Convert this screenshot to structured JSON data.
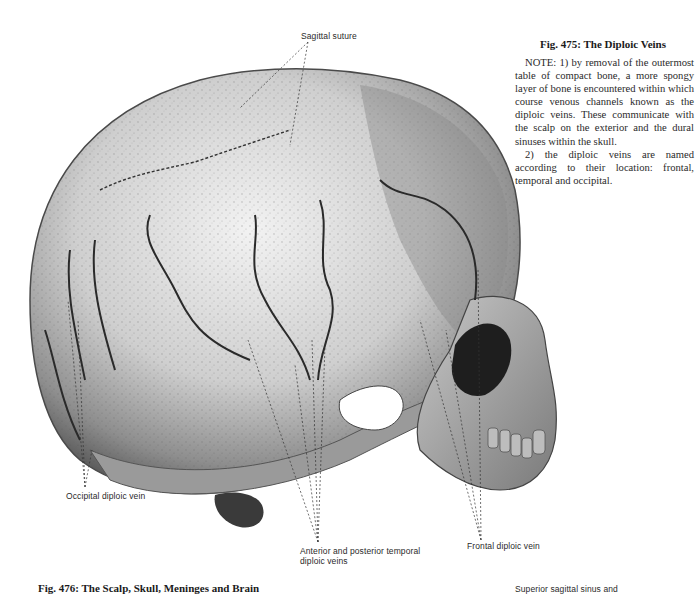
{
  "figure_475": {
    "title": "Fig. 475: The Diploic Veins",
    "note_paragraphs": [
      "NOTE: 1) by removal of the outermost table of compact bone, a more spongy layer of bone is encountered within which course venous channels known as the diploic veins. These communicate with the scalp on the exterior and the dural sinuses within the skull.",
      "2) the diploic veins are named according to their location: frontal, temporal and occipital."
    ]
  },
  "illustration": {
    "subject": "skull-lateral-view-diploic-veins",
    "labels": {
      "sagittal_suture": "Sagittal suture",
      "occipital_diploic_vein": "Occipital diploic vein",
      "temporal_diploic_veins_line1": "Anterior and posterior temporal",
      "temporal_diploic_veins_line2": "diploic veins",
      "frontal_diploic_vein": "Frontal diploic vein"
    }
  },
  "figure_476": {
    "title": "Fig. 476: The Scalp, Skull, Meninges and Brain",
    "partial_label": "Superior sagittal sinus and"
  }
}
